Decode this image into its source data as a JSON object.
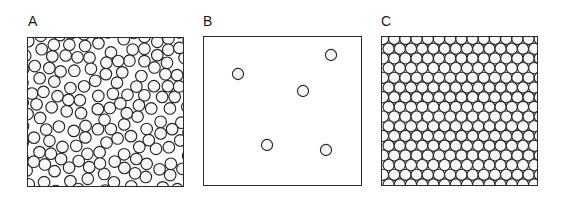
{
  "figure": {
    "background_color": "#ffffff",
    "line_color": "#2b2b2b",
    "circle_fill": "#f7f7f7",
    "circle_stroke": "#262626"
  },
  "panels": [
    {
      "id": "A",
      "label": "A",
      "label_x": 28,
      "label_y": 14,
      "box_x": 27,
      "box_y": 37,
      "box_w": 157,
      "box_h": 150,
      "packing_type": "random-dense",
      "state_name": "liquid",
      "circle_radius": 5.8,
      "circle_count": 176,
      "border_width": 1.6
    },
    {
      "id": "B",
      "label": "B",
      "label_x": 203,
      "label_y": 14,
      "box_x": 203,
      "box_y": 36,
      "box_w": 159,
      "box_h": 150,
      "packing_type": "dilute-gas",
      "state_name": "gas",
      "circle_radius": 5.6,
      "circle_count": 5,
      "border_width": 1.6,
      "circles": [
        {
          "cx": 237,
          "cy": 73
        },
        {
          "cx": 330,
          "cy": 54
        },
        {
          "cx": 302,
          "cy": 90
        },
        {
          "cx": 266,
          "cy": 144
        },
        {
          "cx": 325,
          "cy": 149
        }
      ]
    },
    {
      "id": "C",
      "label": "C",
      "label_x": 381,
      "label_y": 14,
      "box_x": 381,
      "box_y": 36,
      "box_w": 157,
      "box_h": 150,
      "packing_type": "hexagonal-lattice",
      "state_name": "crystal-solid",
      "circle_radius": 5.6,
      "lattice_spacing_x": 11.2,
      "lattice_spacing_y": 9.7,
      "circle_count": 240,
      "border_width": 1.6
    }
  ]
}
